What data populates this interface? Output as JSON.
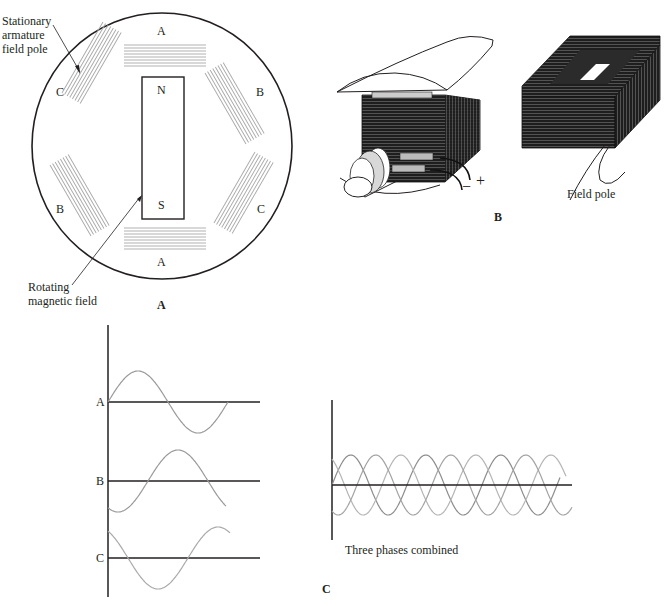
{
  "panel_a": {
    "caption": "A",
    "callout_top": [
      "Stationary",
      "armature",
      "field pole"
    ],
    "callout_bottom": [
      "Rotating",
      "magnetic field"
    ],
    "rotor": {
      "north": "N",
      "south": "S"
    },
    "pole_labels": {
      "top": "A",
      "bottom": "A",
      "upper_left": "C",
      "upper_right": "B",
      "lower_left": "B",
      "lower_right": "C"
    }
  },
  "panel_b": {
    "caption": "B",
    "field_pole_label": "Field pole",
    "plus": "+",
    "minus": "−"
  },
  "panel_c": {
    "caption": "C",
    "phase_labels": [
      "A",
      "B",
      "C"
    ],
    "combined_label": "Three phases combined"
  },
  "colors": {
    "ink": "#231f20",
    "wave": "#9a9a9a",
    "coil_gray": "#b0b0b0",
    "coil_dark": "#2a2a2a"
  }
}
